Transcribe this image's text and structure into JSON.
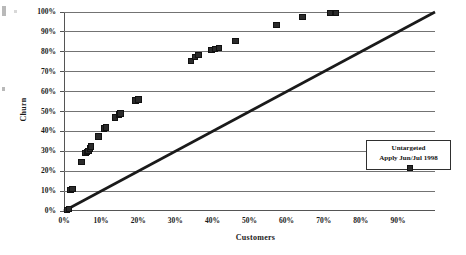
{
  "chart_data": {
    "type": "scatter",
    "title": "",
    "xlabel": "Customers",
    "ylabel": "Churn",
    "xlim": [
      0,
      100
    ],
    "ylim": [
      0,
      100
    ],
    "x_tick_labels": [
      "0%",
      "10%",
      "20%",
      "30%",
      "40%",
      "50%",
      "60%",
      "70%",
      "80%",
      "90%"
    ],
    "x_tick_values": [
      0,
      10,
      20,
      30,
      40,
      50,
      60,
      70,
      80,
      90
    ],
    "y_tick_labels": [
      "0%",
      "10%",
      "20%",
      "30%",
      "40%",
      "50%",
      "60%",
      "70%",
      "80%",
      "90%",
      "100%"
    ],
    "y_tick_values": [
      0,
      10,
      20,
      30,
      40,
      50,
      60,
      70,
      80,
      90,
      100
    ],
    "grid": "horizontal",
    "legend_position": "inside-right",
    "series": [
      {
        "name": "Untargeted Apply Jun/Jul 1998",
        "marker": "square",
        "color": "#2b2b2b",
        "points": [
          [
            0.5,
            1
          ],
          [
            1.0,
            1.5
          ],
          [
            1.5,
            11
          ],
          [
            2.0,
            11.5
          ],
          [
            4.5,
            25
          ],
          [
            5.5,
            29.5
          ],
          [
            6.0,
            30
          ],
          [
            6.3,
            30.5
          ],
          [
            6.8,
            32
          ],
          [
            7.0,
            33
          ],
          [
            9.0,
            38
          ],
          [
            10.5,
            42
          ],
          [
            11.0,
            42.5
          ],
          [
            13.5,
            47.5
          ],
          [
            14.5,
            49
          ],
          [
            15.0,
            49.5
          ],
          [
            19.0,
            56
          ],
          [
            19.8,
            56.5
          ],
          [
            34.0,
            76
          ],
          [
            35.0,
            78
          ],
          [
            36.0,
            79
          ],
          [
            39.5,
            81.5
          ],
          [
            40.5,
            82
          ],
          [
            41.5,
            82.5
          ],
          [
            46.0,
            86
          ],
          [
            57.0,
            94
          ],
          [
            64.0,
            98
          ],
          [
            71.5,
            100
          ],
          [
            73.0,
            100
          ]
        ]
      }
    ],
    "reference_line": {
      "name": "diagonal-baseline",
      "from": [
        0,
        0
      ],
      "to": [
        100,
        100
      ],
      "color": "#1a1a1a",
      "width": 2.6
    }
  },
  "legend": {
    "line1": "Untargeted",
    "line2": "Apply Jun/Jul 1998"
  }
}
